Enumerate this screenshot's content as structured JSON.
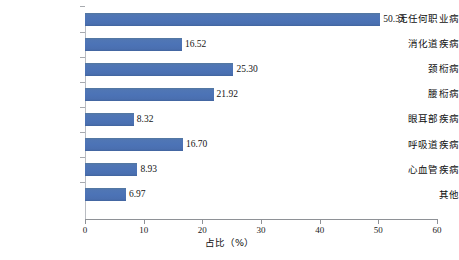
{
  "chart_data": {
    "type": "bar",
    "orientation": "horizontal",
    "title": "",
    "xlabel": "占比（%）",
    "ylabel": "",
    "xlim": [
      0,
      60
    ],
    "xticks": [
      0,
      10,
      20,
      30,
      40,
      50,
      60
    ],
    "xtick_labels": [
      "0",
      "10",
      "20",
      "30",
      "40",
      "50",
      "60"
    ],
    "grid": false,
    "legend": null,
    "bar_color": "#4c73b6",
    "axis_color": "#8e9196",
    "categories": [
      "无任何职业病",
      "消化道疾病",
      "颈椼病",
      "腰椼病",
      "眼耳部疾病",
      "呼吸道疾病",
      "心血管疾病",
      "其他"
    ],
    "values": [
      50.33,
      16.52,
      25.3,
      21.92,
      8.32,
      16.7,
      8.93,
      6.97
    ],
    "value_labels": [
      "50.33",
      "16.52",
      "25.30",
      "21.92",
      "8.32",
      "16.70",
      "8.93",
      "6.97"
    ]
  }
}
